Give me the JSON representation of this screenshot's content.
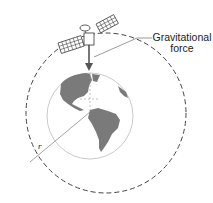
{
  "diagram": {
    "type": "satellite-orbit",
    "labels": {
      "force_line1": "Gravitational",
      "force_line2": "force",
      "radius": "r"
    },
    "colors": {
      "orbit": "#444444",
      "earth_outline": "#bbbbbb",
      "land": "#7a7a7a",
      "arrow": "#555555",
      "text": "#222222"
    },
    "elements": [
      "satellite",
      "dashed-orbit",
      "earth-globe",
      "gravitational-force-arrow",
      "radius-line"
    ]
  }
}
